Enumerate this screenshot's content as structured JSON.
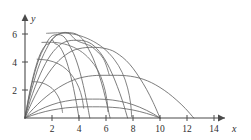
{
  "figure": {
    "background_color": "#ffffff",
    "axis_color": "#4a4a4a",
    "curve_color": "#666666"
  },
  "chart_data": {
    "type": "line",
    "title": "",
    "subtitle": "",
    "xlabel": "x",
    "ylabel": "y",
    "xlim": [
      0,
      15
    ],
    "ylim": [
      0,
      7
    ],
    "grid": false,
    "legend": false,
    "legend_position": "none",
    "x_ticks": [
      2,
      4,
      6,
      8,
      10,
      12,
      14
    ],
    "x_tick_labels": [
      "2",
      "4",
      "6",
      "8",
      "10",
      "12",
      "14"
    ],
    "y_ticks": [
      2,
      4,
      6
    ],
    "y_tick_labels": [
      "2",
      "4",
      "6"
    ],
    "series": [
      {
        "name": "trajectory-1",
        "launch_angle_deg": 85,
        "range": 4.0,
        "apex_x": 2.0,
        "apex_y": 5.6,
        "points": [
          [
            0.0,
            0.0
          ],
          [
            0.2,
            1.12
          ],
          [
            0.4,
            2.1
          ],
          [
            0.6,
            2.95
          ],
          [
            0.8,
            3.67
          ],
          [
            1.0,
            4.26
          ],
          [
            1.2,
            4.72
          ],
          [
            1.4,
            5.05
          ],
          [
            1.6,
            5.25
          ],
          [
            1.8,
            5.32
          ],
          [
            2.0,
            5.6
          ],
          [
            2.2,
            5.32
          ],
          [
            2.4,
            5.25
          ],
          [
            2.6,
            5.05
          ],
          [
            2.8,
            4.72
          ],
          [
            3.0,
            4.26
          ],
          [
            3.2,
            3.67
          ],
          [
            3.4,
            2.95
          ],
          [
            3.6,
            2.1
          ],
          [
            3.8,
            1.12
          ],
          [
            4.0,
            0.0
          ]
        ]
      },
      {
        "name": "trajectory-2",
        "launch_angle_deg": 80,
        "range": 4.8,
        "apex_x": 2.4,
        "apex_y": 5.95,
        "points": [
          [
            0.0,
            0.0
          ],
          [
            0.24,
            1.24
          ],
          [
            0.48,
            2.32
          ],
          [
            0.72,
            3.24
          ],
          [
            0.96,
            4.0
          ],
          [
            1.2,
            4.6
          ],
          [
            1.44,
            5.05
          ],
          [
            1.68,
            5.5
          ],
          [
            1.92,
            5.8
          ],
          [
            2.16,
            5.93
          ],
          [
            2.4,
            5.95
          ],
          [
            2.64,
            5.93
          ],
          [
            2.88,
            5.8
          ],
          [
            3.12,
            5.5
          ],
          [
            3.36,
            5.05
          ],
          [
            3.6,
            4.6
          ],
          [
            3.84,
            4.0
          ],
          [
            4.08,
            3.24
          ],
          [
            4.32,
            2.32
          ],
          [
            4.56,
            1.24
          ],
          [
            4.8,
            0.0
          ]
        ]
      },
      {
        "name": "trajectory-3",
        "launch_angle_deg": 72,
        "range": 6.3,
        "apex_x": 3.15,
        "apex_y": 6.1,
        "points": [
          [
            0.0,
            0.0
          ],
          [
            0.31,
            1.35
          ],
          [
            0.63,
            2.5
          ],
          [
            0.94,
            3.48
          ],
          [
            1.26,
            4.28
          ],
          [
            1.57,
            4.9
          ],
          [
            1.89,
            5.45
          ],
          [
            2.2,
            5.8
          ],
          [
            2.52,
            6.0
          ],
          [
            2.83,
            6.08
          ],
          [
            3.15,
            6.1
          ],
          [
            3.46,
            6.08
          ],
          [
            3.78,
            6.0
          ],
          [
            4.09,
            5.8
          ],
          [
            4.41,
            5.45
          ],
          [
            4.72,
            4.9
          ],
          [
            5.04,
            4.28
          ],
          [
            5.35,
            3.48
          ],
          [
            5.67,
            2.5
          ],
          [
            5.98,
            1.35
          ],
          [
            6.3,
            0.0
          ]
        ]
      },
      {
        "name": "trajectory-4",
        "launch_angle_deg": 62,
        "range": 7.6,
        "apex_x": 3.8,
        "apex_y": 5.55,
        "points": [
          [
            0.0,
            0.0
          ],
          [
            0.38,
            1.22
          ],
          [
            0.76,
            2.25
          ],
          [
            1.14,
            3.15
          ],
          [
            1.52,
            3.9
          ],
          [
            1.9,
            4.5
          ],
          [
            2.28,
            4.95
          ],
          [
            2.66,
            5.28
          ],
          [
            3.04,
            5.46
          ],
          [
            3.42,
            5.54
          ],
          [
            3.8,
            5.55
          ],
          [
            4.18,
            5.54
          ],
          [
            4.56,
            5.46
          ],
          [
            4.94,
            5.28
          ],
          [
            5.32,
            4.95
          ],
          [
            5.7,
            4.5
          ],
          [
            6.08,
            3.9
          ],
          [
            6.46,
            3.15
          ],
          [
            6.84,
            2.25
          ],
          [
            7.22,
            1.22
          ],
          [
            7.6,
            0.0
          ]
        ]
      },
      {
        "name": "trajectory-5",
        "launch_angle_deg": 50,
        "range": 10.0,
        "apex_x": 5.0,
        "apex_y": 5.05,
        "points": [
          [
            0.0,
            0.0
          ],
          [
            0.5,
            1.1
          ],
          [
            1.0,
            2.05
          ],
          [
            1.5,
            2.85
          ],
          [
            2.0,
            3.55
          ],
          [
            2.5,
            4.1
          ],
          [
            3.0,
            4.5
          ],
          [
            3.5,
            4.8
          ],
          [
            4.0,
            4.95
          ],
          [
            4.5,
            5.03
          ],
          [
            5.0,
            5.05
          ],
          [
            5.5,
            5.03
          ],
          [
            6.0,
            4.95
          ],
          [
            6.5,
            4.8
          ],
          [
            7.0,
            4.5
          ],
          [
            7.5,
            4.1
          ],
          [
            8.0,
            3.55
          ],
          [
            8.5,
            2.85
          ],
          [
            9.0,
            2.05
          ],
          [
            9.5,
            1.1
          ],
          [
            10.0,
            0.0
          ]
        ]
      },
      {
        "name": "trajectory-6",
        "launch_angle_deg": 44,
        "range": 12.5,
        "apex_x": 6.25,
        "apex_y": 3.05,
        "points": [
          [
            0.0,
            0.0
          ],
          [
            0.63,
            0.68
          ],
          [
            1.25,
            1.26
          ],
          [
            1.88,
            1.76
          ],
          [
            2.5,
            2.18
          ],
          [
            3.13,
            2.52
          ],
          [
            3.75,
            2.77
          ],
          [
            4.38,
            2.93
          ],
          [
            5.0,
            3.02
          ],
          [
            5.63,
            3.05
          ],
          [
            6.25,
            3.05
          ],
          [
            6.88,
            3.05
          ],
          [
            7.5,
            3.02
          ],
          [
            8.13,
            2.93
          ],
          [
            8.75,
            2.77
          ],
          [
            9.38,
            2.52
          ],
          [
            10.0,
            2.18
          ],
          [
            10.63,
            1.76
          ],
          [
            11.25,
            1.26
          ],
          [
            11.88,
            0.68
          ],
          [
            12.5,
            0.0
          ]
        ]
      },
      {
        "name": "trajectory-7",
        "launch_angle_deg": 22,
        "range": 10.0,
        "apex_x": 5.0,
        "apex_y": 1.35,
        "points": [
          [
            0.0,
            0.0
          ],
          [
            0.5,
            0.3
          ],
          [
            1.0,
            0.55
          ],
          [
            1.5,
            0.77
          ],
          [
            2.0,
            0.95
          ],
          [
            2.5,
            1.1
          ],
          [
            3.0,
            1.2
          ],
          [
            3.5,
            1.28
          ],
          [
            4.0,
            1.33
          ],
          [
            4.5,
            1.35
          ],
          [
            5.0,
            1.35
          ],
          [
            5.5,
            1.35
          ],
          [
            6.0,
            1.33
          ],
          [
            6.5,
            1.28
          ],
          [
            7.0,
            1.2
          ],
          [
            7.5,
            1.1
          ],
          [
            8.0,
            0.95
          ],
          [
            8.5,
            0.77
          ],
          [
            9.0,
            0.55
          ],
          [
            9.5,
            0.3
          ],
          [
            10.0,
            0.0
          ]
        ]
      },
      {
        "name": "trajectory-8",
        "launch_angle_deg": 13,
        "range": 10.0,
        "apex_x": 5.0,
        "apex_y": 0.8,
        "points": [
          [
            0.0,
            0.0
          ],
          [
            0.5,
            0.18
          ],
          [
            1.0,
            0.33
          ],
          [
            1.5,
            0.46
          ],
          [
            2.0,
            0.57
          ],
          [
            2.5,
            0.65
          ],
          [
            3.0,
            0.72
          ],
          [
            3.5,
            0.76
          ],
          [
            4.0,
            0.79
          ],
          [
            4.5,
            0.8
          ],
          [
            5.0,
            0.8
          ],
          [
            5.5,
            0.8
          ],
          [
            6.0,
            0.79
          ],
          [
            6.5,
            0.76
          ],
          [
            7.0,
            0.72
          ],
          [
            7.5,
            0.65
          ],
          [
            8.0,
            0.57
          ],
          [
            8.5,
            0.46
          ],
          [
            9.0,
            0.33
          ],
          [
            9.5,
            0.18
          ],
          [
            10.0,
            0.0
          ]
        ]
      }
    ],
    "cross_curves": [
      {
        "name": "isochrone-1",
        "points": [
          [
            0.55,
            2.6
          ],
          [
            1.1,
            2.55
          ],
          [
            1.55,
            2.4
          ],
          [
            2.0,
            2.12
          ],
          [
            2.3,
            1.78
          ],
          [
            2.55,
            1.35
          ],
          [
            2.7,
            0.85
          ],
          [
            2.78,
            0.4
          ]
        ]
      },
      {
        "name": "isochrone-2",
        "points": [
          [
            0.9,
            4.2
          ],
          [
            1.7,
            4.12
          ],
          [
            2.45,
            3.88
          ],
          [
            3.1,
            3.45
          ],
          [
            3.6,
            2.88
          ],
          [
            3.98,
            2.2
          ],
          [
            4.22,
            1.45
          ],
          [
            4.35,
            0.7
          ]
        ]
      },
      {
        "name": "isochrone-3",
        "points": [
          [
            1.25,
            5.4
          ],
          [
            2.2,
            5.4
          ],
          [
            3.15,
            5.22
          ],
          [
            4.05,
            4.82
          ],
          [
            4.8,
            4.2
          ],
          [
            5.4,
            3.4
          ],
          [
            5.8,
            2.45
          ],
          [
            6.05,
            1.4
          ],
          [
            6.15,
            0.45
          ]
        ]
      },
      {
        "name": "isochrone-4",
        "points": [
          [
            1.6,
            6.05
          ],
          [
            2.7,
            6.08
          ],
          [
            3.8,
            5.95
          ],
          [
            4.85,
            5.58
          ],
          [
            5.8,
            5.0
          ],
          [
            6.6,
            4.2
          ],
          [
            7.2,
            3.25
          ],
          [
            7.6,
            2.15
          ],
          [
            7.82,
            1.05
          ],
          [
            7.9,
            0.1
          ]
        ]
      },
      {
        "name": "apex-envelope",
        "points": [
          [
            2.0,
            5.6
          ],
          [
            2.4,
            5.95
          ],
          [
            3.15,
            6.1
          ],
          [
            3.8,
            5.55
          ],
          [
            4.6,
            5.25
          ],
          [
            5.0,
            5.05
          ],
          [
            5.8,
            4.25
          ],
          [
            6.25,
            3.05
          ]
        ]
      }
    ]
  },
  "axes": {
    "x_axis_label": "x",
    "y_axis_label": "y"
  }
}
